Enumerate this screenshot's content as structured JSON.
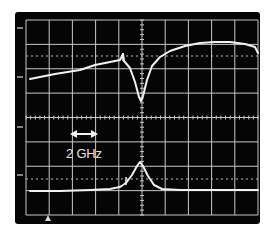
{
  "chart_data": {
    "type": "line",
    "title": "",
    "xlabel": "",
    "ylabel": "",
    "grid": true,
    "divisions": {
      "x": 10,
      "y": 8
    },
    "annotations": [
      {
        "text": "2 GHz",
        "kind": "scale-bar",
        "note": "double-headed arrow spans one horizontal division = 2 GHz"
      }
    ],
    "series": [
      {
        "name": "upper-trace-transmission",
        "description": "Slowly rising baseline with a sharp absorption dip at the center frequency",
        "points_px": [
          [
            30,
            79
          ],
          [
            55,
            74
          ],
          [
            80,
            70
          ],
          [
            95,
            65
          ],
          [
            110,
            62
          ],
          [
            120,
            60
          ],
          [
            123,
            54
          ],
          [
            124,
            61
          ],
          [
            130,
            68
          ],
          [
            135,
            82
          ],
          [
            139,
            97
          ],
          [
            141,
            101
          ],
          [
            143,
            96
          ],
          [
            147,
            80
          ],
          [
            152,
            66
          ],
          [
            160,
            57
          ],
          [
            170,
            51
          ],
          [
            185,
            46
          ],
          [
            200,
            43
          ],
          [
            215,
            42
          ],
          [
            230,
            42
          ],
          [
            245,
            44
          ],
          [
            255,
            47
          ],
          [
            258,
            53
          ]
        ]
      },
      {
        "name": "lower-trace-resonance",
        "description": "Flat baseline with a single Lorentzian-like peak at the center frequency",
        "points_px": [
          [
            30,
            191
          ],
          [
            60,
            191
          ],
          [
            90,
            190
          ],
          [
            110,
            189
          ],
          [
            120,
            187
          ],
          [
            126,
            183
          ],
          [
            132,
            175
          ],
          [
            137,
            166
          ],
          [
            140,
            162
          ],
          [
            143,
            166
          ],
          [
            148,
            176
          ],
          [
            154,
            185
          ],
          [
            162,
            189
          ],
          [
            180,
            190
          ],
          [
            220,
            190
          ],
          [
            258,
            190
          ]
        ]
      }
    ],
    "reference_lines": {
      "upper_dotted_y_px": 56,
      "lower_dotted_y_px": 179
    },
    "left_markers_y_px": [
      28,
      77,
      127,
      175
    ],
    "bottom_marker_x_px": 48
  },
  "display": {
    "scale_label": "2 GHz",
    "frame_color": "#050505",
    "grid_color": "#cfcfcf",
    "trace_color": "#f2f2f2",
    "background": "#ffffff"
  }
}
